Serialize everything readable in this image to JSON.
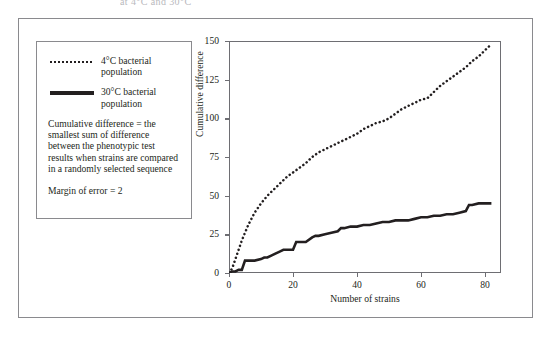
{
  "truncated_title": "at 4°C and 30°C",
  "legend": {
    "entries": [
      {
        "marker": "dotted-line-swatch",
        "label": "4°C bacterial population"
      },
      {
        "marker": "solid-line-swatch",
        "label": "30°C bacterial population"
      }
    ],
    "definition_note": "Cumulative difference = the smallest sum of difference between the phenotypic test results when strains are compared in a randomly selected sequence",
    "margin_note": "Margin of error = 2"
  },
  "chart_data": {
    "type": "line",
    "title": "",
    "xlabel": "Number of strains",
    "ylabel": "Cumulative difference",
    "xlim": [
      0,
      85
    ],
    "ylim": [
      0,
      150
    ],
    "xticks": [
      0,
      20,
      40,
      60,
      80
    ],
    "yticks": [
      0,
      25,
      50,
      75,
      100,
      125,
      150
    ],
    "grid": false,
    "legend_position": "left-outside",
    "series": [
      {
        "name": "4°C bacterial population",
        "style": "dotted",
        "color": "#231f20",
        "x": [
          0,
          1,
          2,
          3,
          4,
          5,
          6,
          7,
          8,
          9,
          10,
          12,
          14,
          16,
          18,
          20,
          22,
          24,
          26,
          28,
          30,
          32,
          34,
          36,
          38,
          40,
          42,
          44,
          46,
          48,
          50,
          52,
          54,
          56,
          58,
          60,
          62,
          64,
          66,
          68,
          70,
          72,
          74,
          76,
          78,
          80,
          82
        ],
        "y": [
          0,
          3,
          9,
          15,
          21,
          26,
          31,
          35,
          39,
          42,
          45,
          50,
          54,
          58,
          62,
          65,
          68,
          71,
          75,
          78,
          80,
          82,
          84,
          86,
          88,
          90,
          93,
          95,
          97,
          98,
          100,
          103,
          106,
          108,
          110,
          112,
          113,
          117,
          121,
          124,
          127,
          130,
          133,
          137,
          140,
          144,
          148
        ]
      },
      {
        "name": "30°C bacterial population",
        "style": "solid",
        "color": "#231f20",
        "x": [
          0,
          1,
          2,
          3,
          4,
          5,
          6,
          8,
          10,
          11,
          12,
          14,
          16,
          17,
          18,
          20,
          21,
          22,
          24,
          26,
          27,
          28,
          30,
          32,
          34,
          35,
          36,
          38,
          40,
          42,
          44,
          46,
          48,
          50,
          52,
          54,
          56,
          58,
          60,
          62,
          64,
          66,
          68,
          70,
          72,
          74,
          75,
          76,
          78,
          80,
          82
        ],
        "y": [
          0,
          1,
          1,
          2,
          2,
          8,
          8,
          8,
          9,
          10,
          10,
          12,
          14,
          15,
          15,
          15,
          20,
          20,
          20,
          23,
          24,
          24,
          25,
          26,
          27,
          29,
          29,
          30,
          30,
          31,
          31,
          32,
          33,
          33,
          34,
          34,
          34,
          35,
          36,
          36,
          37,
          37,
          38,
          38,
          39,
          40,
          44,
          44,
          45,
          45,
          45
        ]
      }
    ]
  }
}
